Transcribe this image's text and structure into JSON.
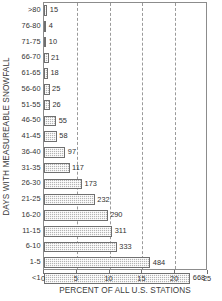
{
  "chart_data": {
    "type": "bar",
    "orientation": "horizontal",
    "title": "",
    "xlabel": "PERCENT OF ALL U.S. STATIONS",
    "ylabel": "DAYS WITH MEASUREABLE SNOWFALL",
    "xlim": [
      0,
      25
    ],
    "xticks": [
      0,
      5,
      10,
      15,
      20,
      25
    ],
    "xtick_labels": [
      "0",
      "5",
      "10",
      "15",
      "20",
      "25"
    ],
    "grid": "vertical-dashed",
    "legend": "none",
    "value_label_note": "Bar end labels are station counts; bar length is percent of all U.S. stations.",
    "categories": [
      ">80",
      "76-80",
      "71-75",
      "66-70",
      "61-65",
      "56-60",
      "51-55",
      "46-50",
      "41-45",
      "36-40",
      "31-35",
      "26-30",
      "21-25",
      "16-20",
      "11-15",
      "6-10",
      "1-5",
      "<1"
    ],
    "counts": [
      15,
      4,
      10,
      21,
      18,
      25,
      26,
      55,
      58,
      97,
      117,
      173,
      232,
      290,
      311,
      333,
      484,
      668
    ],
    "values": [
      0.5,
      0.15,
      0.35,
      0.7,
      0.6,
      0.85,
      0.9,
      1.85,
      1.95,
      3.25,
      3.9,
      5.8,
      7.75,
      9.7,
      10.4,
      11.1,
      16.2,
      22.3
    ],
    "count_labels": [
      "15",
      "4",
      "10",
      "21",
      "18",
      "25",
      "26",
      "55",
      "58",
      "97",
      "117",
      "173",
      "232",
      "290",
      "311",
      "333",
      "484",
      "668"
    ]
  },
  "style": {
    "bar_fill": "#b4b4b4",
    "bar_edge": "#6f6f6f",
    "axis_color": "#8c8c8c",
    "grid_color": "#9a9a9a",
    "text_color": "#343434",
    "background": "#ffffff"
  }
}
